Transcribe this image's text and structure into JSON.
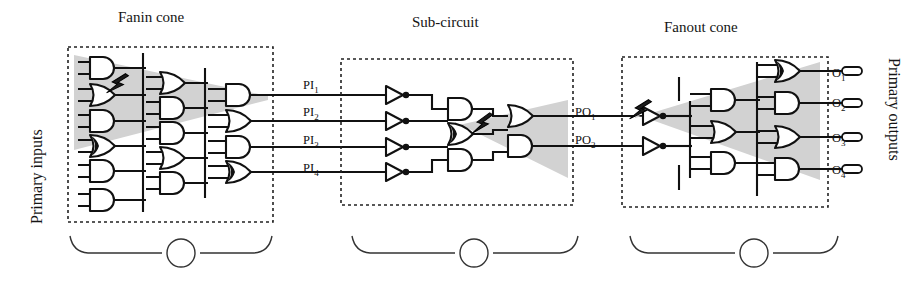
{
  "figure": {
    "type": "circuit-diagram",
    "titles": {
      "fanin": "Fanin cone",
      "subcircuit": "Sub-circuit",
      "fanout": "Fanout cone"
    },
    "side_labels": {
      "left": "Primary inputs",
      "right": "Primary outputs"
    },
    "colors": {
      "cone_fill": "#d2d2d2",
      "wire": "#111111",
      "box_border": "#222222",
      "gate_fill": "#ffffff",
      "fault_marker": "#1a1a1a",
      "page_background": "#ffffff"
    },
    "primary_input_nets": [
      {
        "label": "PI",
        "sub": "1"
      },
      {
        "label": "PI",
        "sub": "2"
      },
      {
        "label": "PI",
        "sub": "3"
      },
      {
        "label": "PI",
        "sub": "4"
      }
    ],
    "internal_nets": [
      {
        "label": "PO",
        "sub": "1"
      },
      {
        "label": "PO",
        "sub": "2"
      }
    ],
    "primary_output_nets": [
      {
        "label": "O",
        "sub": "1"
      },
      {
        "label": "O",
        "sub": "2"
      },
      {
        "label": "O",
        "sub": "3"
      },
      {
        "label": "O",
        "sub": "4"
      }
    ],
    "braces": [
      {
        "id": "A",
        "region": "fanin"
      },
      {
        "id": "B",
        "region": "subcircuit"
      },
      {
        "id": "C",
        "region": "fanout"
      }
    ],
    "fault_markers": [
      {
        "id": "fault-fanin",
        "region": "fanin"
      },
      {
        "id": "fault-subcircuit",
        "region": "subcircuit"
      },
      {
        "id": "fault-fanout",
        "region": "fanout"
      }
    ],
    "blocks": [
      {
        "id": "fanin",
        "title": "Fanin cone",
        "brace": "A",
        "gate_counts": {
          "column1": 6,
          "column2": 6,
          "column3": 4
        },
        "cone_direction": "narrowing-right"
      },
      {
        "id": "subcircuit",
        "title": "Sub-circuit",
        "brace": "B",
        "gate_counts": {
          "inverters": 4,
          "column2": 3,
          "column3": 2
        },
        "cone_direction": "widening-right"
      },
      {
        "id": "fanout",
        "title": "Fanout cone",
        "brace": "C",
        "gate_counts": {
          "inverters": 2,
          "column2": 3,
          "column3": 4
        },
        "cone_direction": "widening-right"
      }
    ]
  }
}
